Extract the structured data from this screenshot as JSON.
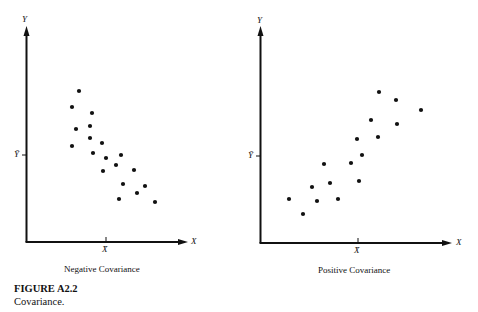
{
  "figure": {
    "title": "FIGURE A2.2",
    "caption": "Covariance."
  },
  "chart_data": [
    {
      "type": "scatter",
      "title": "Negative Covariance",
      "xlabel": "X",
      "ylabel": "Y",
      "mean_markers": {
        "x": "X̄",
        "y": "Ȳ"
      },
      "grid": false,
      "points_px": [
        [
          79,
          91
        ],
        [
          72,
          107
        ],
        [
          92,
          113
        ],
        [
          76,
          129
        ],
        [
          90,
          126
        ],
        [
          90,
          138
        ],
        [
          72,
          146
        ],
        [
          102,
          143
        ],
        [
          93,
          153
        ],
        [
          106,
          158
        ],
        [
          121,
          155
        ],
        [
          116,
          165
        ],
        [
          103,
          171
        ],
        [
          134,
          170
        ],
        [
          123,
          184
        ],
        [
          145,
          186
        ],
        [
          137,
          193
        ],
        [
          119,
          199
        ],
        [
          155,
          202
        ]
      ]
    },
    {
      "type": "scatter",
      "title": "Positive Covariance",
      "xlabel": "X",
      "ylabel": "Y",
      "mean_markers": {
        "x": "X̄",
        "y": "Ȳ"
      },
      "grid": false,
      "points_px": [
        [
          379,
          92
        ],
        [
          396,
          100
        ],
        [
          421,
          110
        ],
        [
          371,
          120
        ],
        [
          397,
          124
        ],
        [
          357,
          139
        ],
        [
          378,
          137
        ],
        [
          362,
          155
        ],
        [
          324,
          164
        ],
        [
          351,
          163
        ],
        [
          312,
          187
        ],
        [
          330,
          183
        ],
        [
          359,
          181
        ],
        [
          289,
          199
        ],
        [
          317,
          201
        ],
        [
          338,
          199
        ],
        [
          303,
          214
        ]
      ]
    }
  ],
  "left": {
    "title": "Negative Covariance",
    "x": "X",
    "y": "Y",
    "xbar": "X̄",
    "ybar": "Ȳ"
  },
  "right": {
    "title": "Positive Covariance",
    "x": "X",
    "y": "Y",
    "xbar": "X̄",
    "ybar": "Ȳ"
  }
}
